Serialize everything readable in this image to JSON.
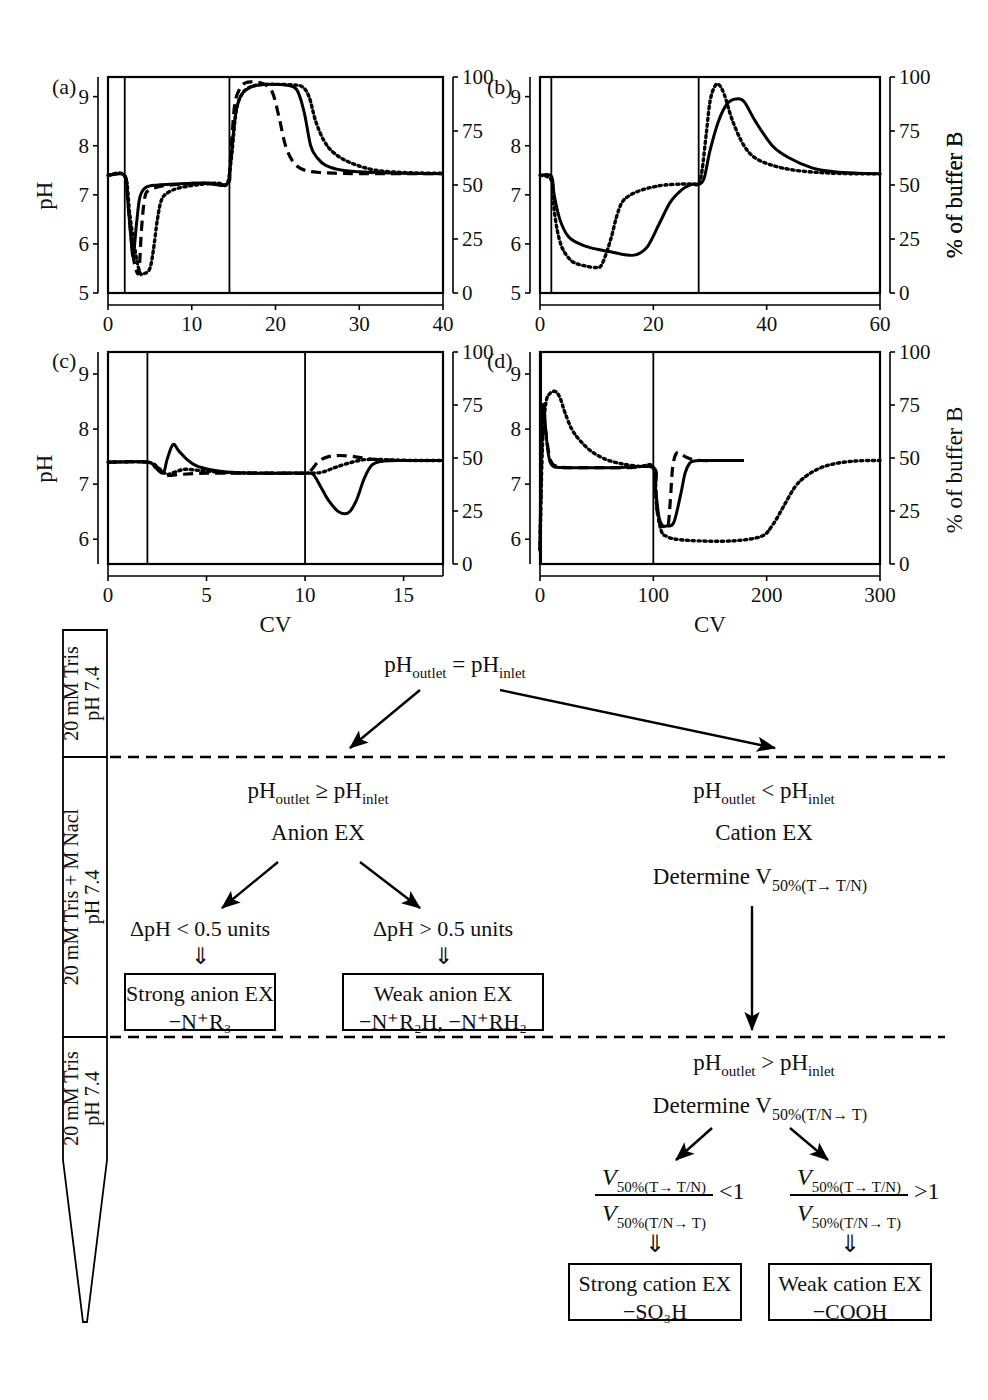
{
  "figure": {
    "axis_labels": {
      "y_left": "pH",
      "y_right": "% of buffer B",
      "x": "CV"
    }
  },
  "chart_data": [
    {
      "type": "line",
      "panel": "(a)",
      "title": "(a)",
      "xlabel": "",
      "ylabel": "pH",
      "y2label": "% of buffer B",
      "xlim": [
        0,
        40
      ],
      "ylim": [
        5,
        9.4
      ],
      "y2lim": [
        0,
        100
      ],
      "xticks": [
        0,
        10,
        20,
        30,
        40
      ],
      "yticks": [
        5,
        6,
        7,
        8,
        9
      ],
      "y2ticks": [
        0,
        25,
        50,
        75,
        100
      ],
      "grid": false,
      "legend": "none",
      "series": [
        {
          "name": "buffer-B-gradient",
          "style": "solid-step",
          "axis": "right",
          "x": [
            0,
            2,
            2,
            14.5,
            14.5,
            40
          ],
          "values": [
            0,
            0,
            100,
            100,
            0,
            0
          ]
        },
        {
          "name": "pH-solid",
          "style": "solid",
          "axis": "left",
          "x": [
            0,
            2,
            2.3,
            2.7,
            3.0,
            3.4,
            3.8,
            4.5,
            6,
            8,
            11,
            14.2,
            14.6,
            15.2,
            15.8,
            16.6,
            17.5,
            19,
            21,
            22.5,
            23.4,
            24.2,
            25,
            26,
            28,
            31,
            35,
            40
          ],
          "values": [
            7.4,
            7.4,
            7.0,
            6.2,
            5.75,
            6.4,
            6.95,
            7.15,
            7.2,
            7.22,
            7.24,
            7.22,
            7.6,
            8.6,
            9.0,
            9.15,
            9.22,
            9.25,
            9.24,
            9.15,
            8.7,
            8.0,
            7.75,
            7.6,
            7.5,
            7.46,
            7.44,
            7.43
          ]
        },
        {
          "name": "pH-dashed",
          "style": "dashed",
          "axis": "left",
          "x": [
            0,
            2,
            2.4,
            2.9,
            3.3,
            3.7,
            4.0,
            4.4,
            5.0,
            6.5,
            9,
            12,
            14.2,
            14.6,
            15.1,
            15.7,
            16.4,
            17.4,
            18.6,
            19.6,
            20.4,
            21.2,
            22.2,
            23.5,
            25,
            27,
            30,
            34,
            40
          ],
          "values": [
            7.4,
            7.38,
            6.8,
            5.9,
            5.5,
            5.45,
            6.3,
            6.95,
            7.1,
            7.18,
            7.22,
            7.24,
            7.22,
            7.7,
            8.8,
            9.15,
            9.28,
            9.3,
            9.26,
            9.1,
            8.6,
            8.0,
            7.65,
            7.5,
            7.46,
            7.44,
            7.43,
            7.43,
            7.43
          ]
        },
        {
          "name": "pH-dotted",
          "style": "dotted",
          "axis": "left",
          "x": [
            0,
            2,
            2.6,
            3.2,
            3.8,
            4.4,
            5.0,
            5.4,
            5.9,
            6.4,
            7.2,
            8.5,
            10.5,
            13,
            14.2,
            14.7,
            15.3,
            16.0,
            16.8,
            18,
            20,
            22,
            23.2,
            24.0,
            24.8,
            25.8,
            27,
            29,
            32,
            36,
            40
          ],
          "values": [
            7.4,
            7.38,
            6.6,
            5.9,
            5.42,
            5.4,
            5.5,
            5.85,
            6.5,
            6.9,
            7.05,
            7.14,
            7.2,
            7.24,
            7.22,
            7.7,
            8.7,
            9.05,
            9.18,
            9.24,
            9.25,
            9.24,
            9.2,
            9.0,
            8.5,
            8.1,
            7.85,
            7.65,
            7.5,
            7.45,
            7.44
          ]
        }
      ]
    },
    {
      "type": "line",
      "panel": "(b)",
      "title": "(b)",
      "xlabel": "",
      "ylabel": "pH",
      "y2label": "% of buffer B",
      "xlim": [
        0,
        60
      ],
      "ylim": [
        5,
        9.4
      ],
      "y2lim": [
        0,
        100
      ],
      "xticks": [
        0,
        20,
        40,
        60
      ],
      "yticks": [
        5,
        6,
        7,
        8,
        9
      ],
      "y2ticks": [
        0,
        25,
        50,
        75,
        100
      ],
      "grid": false,
      "legend": "none",
      "series": [
        {
          "name": "buffer-B-gradient",
          "style": "solid-step",
          "axis": "right",
          "x": [
            0,
            2,
            2,
            28,
            28,
            60
          ],
          "values": [
            0,
            0,
            100,
            100,
            0,
            0
          ]
        },
        {
          "name": "pH-solid",
          "style": "solid",
          "axis": "left",
          "x": [
            0,
            2,
            2.5,
            3.5,
            5,
            7,
            9,
            12,
            15,
            17,
            19,
            21,
            23,
            25,
            26.5,
            27.5,
            28.2,
            29,
            30,
            31.5,
            33,
            34.5,
            36,
            38,
            41,
            44,
            48,
            52,
            56,
            60
          ],
          "values": [
            7.4,
            7.38,
            7.0,
            6.5,
            6.15,
            6.0,
            5.92,
            5.85,
            5.78,
            5.78,
            5.95,
            6.4,
            6.85,
            7.1,
            7.2,
            7.22,
            7.22,
            7.35,
            7.9,
            8.5,
            8.85,
            8.95,
            8.9,
            8.5,
            8.0,
            7.75,
            7.55,
            7.47,
            7.44,
            7.43
          ]
        },
        {
          "name": "pH-dotted",
          "style": "dotted",
          "axis": "left",
          "x": [
            0,
            2,
            2.4,
            3.0,
            3.8,
            4.8,
            6,
            8,
            10,
            11,
            12.5,
            13.5,
            14.5,
            16,
            18,
            20,
            22,
            25,
            27,
            28,
            28.6,
            29.3,
            30,
            30.8,
            31.5,
            32.5,
            34,
            36,
            38,
            41,
            45,
            50,
            55,
            60
          ],
          "values": [
            7.4,
            7.3,
            6.8,
            6.3,
            5.95,
            5.75,
            5.62,
            5.55,
            5.52,
            5.6,
            6.1,
            6.55,
            6.85,
            7.0,
            7.1,
            7.16,
            7.2,
            7.22,
            7.22,
            7.22,
            7.5,
            8.2,
            8.9,
            9.2,
            9.25,
            9.05,
            8.5,
            8.0,
            7.75,
            7.6,
            7.5,
            7.45,
            7.43,
            7.43
          ]
        }
      ]
    },
    {
      "type": "line",
      "panel": "(c)",
      "title": "(c)",
      "xlabel": "CV",
      "ylabel": "pH",
      "y2label": "% of buffer B",
      "xlim": [
        0,
        17
      ],
      "ylim": [
        5.55,
        9.4
      ],
      "y2lim": [
        0,
        100
      ],
      "xticks": [
        0,
        5,
        10,
        15
      ],
      "yticks": [
        6,
        7,
        8,
        9
      ],
      "y2ticks": [
        0,
        25,
        50,
        75,
        100
      ],
      "grid": false,
      "legend": "none",
      "series": [
        {
          "name": "buffer-B-gradient",
          "style": "solid-step",
          "axis": "right",
          "x": [
            0,
            2,
            2,
            10,
            10,
            17
          ],
          "values": [
            0,
            0,
            100,
            100,
            0,
            0
          ]
        },
        {
          "name": "pH-solid",
          "style": "solid",
          "axis": "left",
          "x": [
            0,
            2,
            2.4,
            2.8,
            3.0,
            3.3,
            3.6,
            4.0,
            4.5,
            5.2,
            6,
            7.5,
            9,
            10,
            10.4,
            10.8,
            11.2,
            11.7,
            12.2,
            12.6,
            13.0,
            13.4,
            14,
            15,
            16,
            17
          ],
          "values": [
            7.4,
            7.4,
            7.3,
            7.2,
            7.45,
            7.72,
            7.6,
            7.45,
            7.33,
            7.26,
            7.22,
            7.2,
            7.2,
            7.2,
            7.18,
            6.95,
            6.7,
            6.5,
            6.48,
            6.7,
            7.1,
            7.35,
            7.42,
            7.43,
            7.43,
            7.43
          ]
        },
        {
          "name": "pH-dashed",
          "style": "dashed",
          "axis": "left",
          "x": [
            0,
            2,
            2.5,
            2.9,
            3.2,
            3.8,
            5,
            7,
            9,
            10,
            10.3,
            10.7,
            11.2,
            11.8,
            12.5,
            13.2,
            14,
            15,
            16,
            17
          ],
          "values": [
            7.4,
            7.4,
            7.3,
            7.17,
            7.16,
            7.18,
            7.2,
            7.2,
            7.2,
            7.2,
            7.25,
            7.42,
            7.5,
            7.52,
            7.5,
            7.46,
            7.44,
            7.43,
            7.43,
            7.43
          ]
        },
        {
          "name": "pH-dotted",
          "style": "dotted",
          "axis": "left",
          "x": [
            0,
            2,
            2.6,
            3.0,
            3.4,
            3.9,
            4.6,
            6,
            8,
            10,
            10.4,
            10.9,
            11.5,
            12.2,
            12.9,
            13.6,
            14.5,
            15.5,
            17
          ],
          "values": [
            7.4,
            7.4,
            7.28,
            7.18,
            7.22,
            7.27,
            7.25,
            7.21,
            7.2,
            7.2,
            7.2,
            7.22,
            7.3,
            7.38,
            7.44,
            7.45,
            7.44,
            7.43,
            7.43
          ]
        }
      ]
    },
    {
      "type": "line",
      "panel": "(d)",
      "title": "(d)",
      "xlabel": "CV",
      "ylabel": "pH",
      "y2label": "% of buffer B",
      "xlim": [
        0,
        300
      ],
      "ylim": [
        5.55,
        9.4
      ],
      "y2lim": [
        0,
        100
      ],
      "xticks": [
        0,
        100,
        200,
        300
      ],
      "yticks": [
        6,
        7,
        8,
        9
      ],
      "y2ticks": [
        0,
        25,
        50,
        75,
        100
      ],
      "grid": false,
      "legend": "none",
      "series": [
        {
          "name": "buffer-B-gradient",
          "style": "solid-step",
          "axis": "right",
          "x": [
            0,
            1,
            1,
            100,
            100,
            300
          ],
          "values": [
            0,
            0,
            100,
            100,
            0,
            0
          ]
        },
        {
          "name": "pH-solid",
          "style": "solid",
          "axis": "left",
          "x": [
            0,
            1,
            2,
            3,
            4,
            5,
            7,
            9,
            12,
            20,
            40,
            70,
            100,
            102,
            105,
            108,
            112,
            118,
            124,
            128,
            132,
            136,
            142,
            150,
            165,
            180
          ],
          "values": [
            5.8,
            7.5,
            8.3,
            8.45,
            8.3,
            8.0,
            7.6,
            7.4,
            7.32,
            7.3,
            7.3,
            7.3,
            7.3,
            6.9,
            6.4,
            6.25,
            6.24,
            6.3,
            6.8,
            7.2,
            7.38,
            7.42,
            7.43,
            7.43,
            7.43,
            7.43
          ]
        },
        {
          "name": "pH-dashed",
          "style": "dashed",
          "axis": "left",
          "x": [
            0,
            1,
            2,
            3,
            4,
            6,
            9,
            14,
            25,
            50,
            80,
            100,
            102,
            104,
            107,
            110,
            113,
            115,
            117,
            120,
            124,
            128,
            134,
            142,
            155,
            170,
            180
          ],
          "values": [
            5.8,
            7.0,
            7.9,
            8.2,
            8.15,
            7.8,
            7.45,
            7.33,
            7.3,
            7.3,
            7.3,
            7.3,
            6.9,
            6.4,
            6.25,
            6.23,
            6.25,
            6.7,
            7.3,
            7.55,
            7.56,
            7.5,
            7.45,
            7.43,
            7.43,
            7.43,
            7.43
          ]
        },
        {
          "name": "pH-dotted",
          "style": "dotted",
          "axis": "left",
          "x": [
            0,
            2,
            5,
            9,
            14,
            18,
            22,
            28,
            35,
            45,
            58,
            72,
            88,
            100,
            103,
            107,
            112,
            120,
            140,
            170,
            195,
            205,
            215,
            225,
            235,
            248,
            262,
            278,
            292,
            300
          ],
          "values": [
            5.8,
            7.6,
            8.45,
            8.65,
            8.68,
            8.55,
            8.3,
            8.0,
            7.8,
            7.6,
            7.45,
            7.37,
            7.32,
            7.3,
            6.6,
            6.15,
            6.05,
            6.0,
            5.97,
            5.97,
            6.05,
            6.25,
            6.6,
            6.95,
            7.15,
            7.3,
            7.38,
            7.42,
            7.43,
            7.43
          ]
        }
      ]
    }
  ],
  "column": {
    "segments": [
      {
        "id": "top",
        "line1": "20 mM Tris",
        "line2": "pH 7.4"
      },
      {
        "id": "middle",
        "line1": "20 mM Tris + M Nacl",
        "line2": "pH 7.4"
      },
      {
        "id": "bottom",
        "line1": "20 mM Tris",
        "line2": "pH 7.4"
      }
    ]
  },
  "flowchart": {
    "root": {
      "text": "pH",
      "sub1": "outlet",
      "op": "=",
      "text2": "pH",
      "sub2": "inlet"
    },
    "left_branch": {
      "condition": {
        "text": "pH",
        "sub1": "outlet",
        "op": "≥",
        "text2": "pH",
        "sub2": "inlet"
      },
      "label": "Anion EX",
      "children": [
        {
          "criterion": "ΔpH < 0.5 units",
          "arrow": "⇓",
          "result_line1": "Strong anion EX",
          "result_line2_parts": [
            "−N",
            "+",
            "R",
            "3"
          ],
          "result_line2": "−N⁺R₃"
        },
        {
          "criterion": "ΔpH > 0.5 units",
          "arrow": "⇓",
          "result_line1": "Weak anion EX",
          "result_line2_parts": [
            "−N",
            "+",
            "R",
            "2",
            "H, −N",
            "+",
            "RH",
            "2"
          ],
          "result_line2": "−N⁺R₂H, −N⁺RH₂"
        }
      ]
    },
    "right_branch": {
      "condition": {
        "text": "pH",
        "sub1": "outlet",
        "op": "<",
        "text2": "pH",
        "sub2": "inlet"
      },
      "label": "Cation EX",
      "determine1": {
        "prefix": "Determine V",
        "sub": "50%(T→ T/N)"
      },
      "condition2": {
        "text": "pH",
        "sub1": "outlet",
        "op": ">",
        "text2": "pH",
        "sub2": "inlet"
      },
      "determine2": {
        "prefix": "Determine V",
        "sub": "50%(T/N→ T)"
      },
      "children": [
        {
          "numerator": "V",
          "numerator_sub": "50%(T→ T/N)",
          "denominator": "V",
          "denominator_sub": "50%(T/N→ T)",
          "comparison": "<1",
          "arrow": "⇓",
          "result_line1": "Strong cation EX",
          "result_line2": "−SO₃H"
        },
        {
          "numerator": "V",
          "numerator_sub": "50%(T→ T/N)",
          "denominator": "V",
          "denominator_sub": "50%(T/N→ T)",
          "comparison": ">1",
          "arrow": "⇓",
          "result_line1": "Weak cation EX",
          "result_line2": "−COOH"
        }
      ]
    }
  }
}
